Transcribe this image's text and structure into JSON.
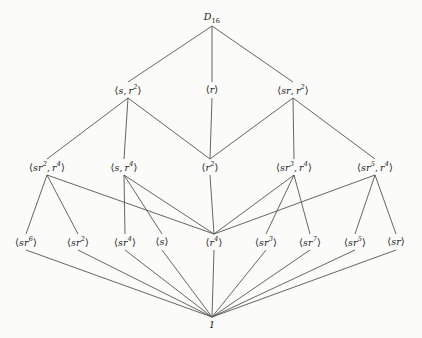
{
  "diagram": {
    "type": "hasse-lattice",
    "background_color": "#fbfbfa",
    "edge_color": "#54544f",
    "text_color": "#1a1a1a",
    "width": 422,
    "height": 338,
    "levels": [
      {
        "index": 0,
        "y": 18,
        "nodes": [
          {
            "id": "D16",
            "label": "D16",
            "base": "D",
            "sub": "16",
            "x": 212,
            "y": 18
          }
        ]
      },
      {
        "index": 1,
        "y": 90,
        "nodes": [
          {
            "id": "s_r2",
            "label": "⟨s, r²⟩",
            "gens": [
              {
                "base": "s"
              },
              {
                "base": "r",
                "exp": "2"
              }
            ],
            "x": 128,
            "y": 90
          },
          {
            "id": "r",
            "label": "⟨r⟩",
            "gens": [
              {
                "base": "r"
              }
            ],
            "x": 212,
            "y": 90
          },
          {
            "id": "sr_r2",
            "label": "⟨sr, r²⟩",
            "gens": [
              {
                "base": "sr"
              },
              {
                "base": "r",
                "exp": "2"
              }
            ],
            "x": 293,
            "y": 90
          }
        ]
      },
      {
        "index": 2,
        "y": 167,
        "nodes": [
          {
            "id": "sr2_r4",
            "label": "⟨sr², r⁴⟩",
            "gens": [
              {
                "base": "sr",
                "exp": "2"
              },
              {
                "base": "r",
                "exp": "4"
              }
            ],
            "x": 47,
            "y": 167
          },
          {
            "id": "s_r4",
            "label": "⟨s, r⁴⟩",
            "gens": [
              {
                "base": "s"
              },
              {
                "base": "r",
                "exp": "4"
              }
            ],
            "x": 124,
            "y": 167
          },
          {
            "id": "r2",
            "label": "⟨r²⟩",
            "gens": [
              {
                "base": "r",
                "exp": "2"
              }
            ],
            "x": 210,
            "y": 167
          },
          {
            "id": "sr3_r4",
            "label": "⟨sr³, r⁴⟩",
            "gens": [
              {
                "base": "sr",
                "exp": "3"
              },
              {
                "base": "r",
                "exp": "4"
              }
            ],
            "x": 294,
            "y": 167
          },
          {
            "id": "sr5_r4",
            "label": "⟨sr⁵, r⁴⟩",
            "gens": [
              {
                "base": "sr",
                "exp": "5"
              },
              {
                "base": "r",
                "exp": "4"
              }
            ],
            "x": 375,
            "y": 167
          }
        ]
      },
      {
        "index": 3,
        "y": 242,
        "nodes": [
          {
            "id": "sr6",
            "label": "⟨sr⁶⟩",
            "gens": [
              {
                "base": "sr",
                "exp": "6"
              }
            ],
            "x": 26,
            "y": 242
          },
          {
            "id": "sr2",
            "label": "⟨sr²⟩",
            "gens": [
              {
                "base": "sr",
                "exp": "2"
              }
            ],
            "x": 78,
            "y": 242
          },
          {
            "id": "sr4",
            "label": "⟨sr⁴⟩",
            "gens": [
              {
                "base": "sr",
                "exp": "4"
              }
            ],
            "x": 125,
            "y": 242
          },
          {
            "id": "s",
            "label": "⟨s⟩",
            "gens": [
              {
                "base": "s"
              }
            ],
            "x": 162,
            "y": 242
          },
          {
            "id": "r4",
            "label": "⟨r⁴⟩",
            "gens": [
              {
                "base": "r",
                "exp": "4"
              }
            ],
            "x": 214,
            "y": 242
          },
          {
            "id": "sr3",
            "label": "⟨sr³⟩",
            "gens": [
              {
                "base": "sr",
                "exp": "3"
              }
            ],
            "x": 266,
            "y": 242
          },
          {
            "id": "sr7",
            "label": "⟨sr⁷⟩",
            "gens": [
              {
                "base": "sr",
                "exp": "7"
              }
            ],
            "x": 310,
            "y": 242
          },
          {
            "id": "sr5",
            "label": "⟨sr⁵⟩",
            "gens": [
              {
                "base": "sr",
                "exp": "5"
              }
            ],
            "x": 355,
            "y": 242
          },
          {
            "id": "sr",
            "label": "⟨sr⟩",
            "gens": [
              {
                "base": "sr"
              }
            ],
            "x": 396,
            "y": 242
          }
        ]
      },
      {
        "index": 4,
        "y": 325,
        "nodes": [
          {
            "id": "one",
            "label": "1",
            "base": "1",
            "x": 212,
            "y": 325
          }
        ]
      }
    ],
    "edges": [
      {
        "from": "D16",
        "to": "s_r2"
      },
      {
        "from": "D16",
        "to": "r"
      },
      {
        "from": "D16",
        "to": "sr_r2"
      },
      {
        "from": "s_r2",
        "to": "sr2_r4"
      },
      {
        "from": "s_r2",
        "to": "s_r4"
      },
      {
        "from": "s_r2",
        "to": "r2"
      },
      {
        "from": "r",
        "to": "r2"
      },
      {
        "from": "sr_r2",
        "to": "r2"
      },
      {
        "from": "sr_r2",
        "to": "sr3_r4"
      },
      {
        "from": "sr_r2",
        "to": "sr5_r4"
      },
      {
        "from": "sr2_r4",
        "to": "sr6"
      },
      {
        "from": "sr2_r4",
        "to": "sr2"
      },
      {
        "from": "sr2_r4",
        "to": "r4"
      },
      {
        "from": "s_r4",
        "to": "sr4"
      },
      {
        "from": "s_r4",
        "to": "s"
      },
      {
        "from": "s_r4",
        "to": "r4"
      },
      {
        "from": "r2",
        "to": "r4"
      },
      {
        "from": "sr3_r4",
        "to": "r4"
      },
      {
        "from": "sr3_r4",
        "to": "sr3"
      },
      {
        "from": "sr3_r4",
        "to": "sr7"
      },
      {
        "from": "sr5_r4",
        "to": "r4"
      },
      {
        "from": "sr5_r4",
        "to": "sr5"
      },
      {
        "from": "sr5_r4",
        "to": "sr"
      },
      {
        "from": "sr6",
        "to": "one"
      },
      {
        "from": "sr2",
        "to": "one"
      },
      {
        "from": "sr4",
        "to": "one"
      },
      {
        "from": "s",
        "to": "one"
      },
      {
        "from": "r4",
        "to": "one"
      },
      {
        "from": "sr3",
        "to": "one"
      },
      {
        "from": "sr7",
        "to": "one"
      },
      {
        "from": "sr5",
        "to": "one"
      },
      {
        "from": "sr",
        "to": "one"
      }
    ]
  }
}
